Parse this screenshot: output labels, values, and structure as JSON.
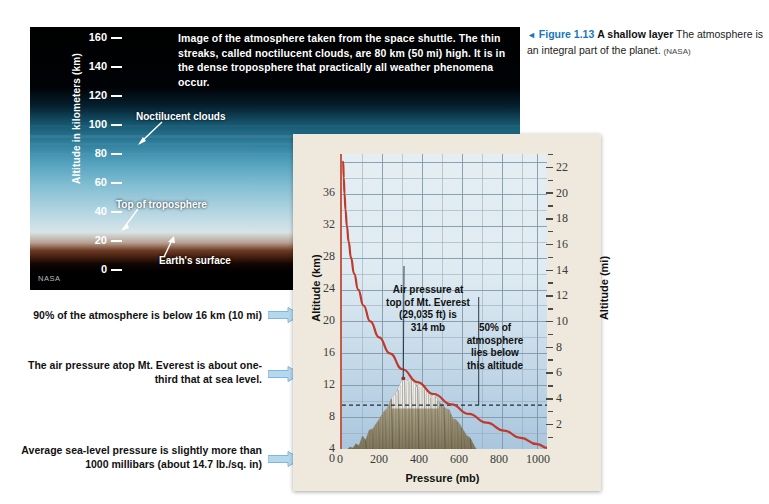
{
  "photo": {
    "description": "Image of the atmosphere taken from the space shuttle. The thin streaks, called noctilucent clouds, are 80 km (50 mi) high. It is in the dense troposphere that practically all weather phenomena occur.",
    "axis_title": "Altitude in kilometers (km)",
    "ticks": [
      "160",
      "140",
      "120",
      "100",
      "80",
      "60",
      "40",
      "20",
      "0"
    ],
    "labels": {
      "noctilucent": "Noctilucent clouds",
      "tropopause": "Top of troposphere",
      "surface": "Earth's surface"
    },
    "credit": "NASA"
  },
  "caption": {
    "triangle": "◄",
    "figure_number": "Figure 1.13",
    "figure_title": "A shallow layer",
    "text": " The atmosphere is an integral part of the planet. ",
    "source": "(NASA)"
  },
  "callouts": [
    {
      "text": "90% of the atmosphere is below 16 km (10 mi)"
    },
    {
      "text": "The air pressure atop Mt. Everest is about one-third that at sea level."
    },
    {
      "text": "Average sea-level pressure is slightly more than 1000 millibars (about 14.7 lb./sq. in)"
    }
  ],
  "chart_data": {
    "type": "line",
    "title": "",
    "xlabel": "Pressure (mb)",
    "ylabel": "Altitude (km)",
    "y2label": "Altitude (mi)",
    "xlim": [
      0,
      1050
    ],
    "ylim": [
      0,
      37
    ],
    "y2lim": [
      0,
      23
    ],
    "xticks": [
      "0",
      "200",
      "400",
      "600",
      "800",
      "1000"
    ],
    "xtick_values": [
      0,
      200,
      400,
      600,
      800,
      1000
    ],
    "yticks": [
      "4",
      "8",
      "12",
      "16",
      "20",
      "24",
      "28",
      "32",
      "36"
    ],
    "ytick_values": [
      4,
      8,
      12,
      16,
      20,
      24,
      28,
      32,
      36
    ],
    "y2ticks": [
      "2",
      "4",
      "6",
      "8",
      "10",
      "12",
      "14",
      "16",
      "18",
      "20",
      "22"
    ],
    "y2tick_values": [
      2,
      4,
      6,
      8,
      10,
      12,
      14,
      16,
      18,
      20,
      22
    ],
    "grid": true,
    "legend": "none",
    "series": [
      {
        "name": "Air pressure vs altitude",
        "color": "#c0392b",
        "x": [
          6,
          9,
          13,
          18,
          25,
          34,
          46,
          62,
          83,
          110,
          145,
          190,
          245,
          310,
          385,
          470,
          560,
          650,
          740,
          830,
          915,
          1000,
          1050
        ],
        "y": [
          36.0,
          34.0,
          32.0,
          30.0,
          28.0,
          26.0,
          24.0,
          22.0,
          20.0,
          18.0,
          16.0,
          14.0,
          12.0,
          10.0,
          8.4,
          6.9,
          5.6,
          4.4,
          3.3,
          2.3,
          1.4,
          0.6,
          0.15
        ]
      }
    ],
    "annotations": [
      {
        "name": "everest-annotation",
        "text": "Air pressure at top of Mt. Everest (29,035 ft) is 314 mb",
        "lines": [
          "Air pressure at",
          "top of Mt. Everest",
          "(29,035 ft) is",
          "314 mb"
        ],
        "point": {
          "x": 314,
          "y": 8.85
        }
      },
      {
        "name": "half-atmosphere-annotation",
        "text": "50% of atmosphere lies below this altitude",
        "lines": [
          "50% of",
          "atmosphere",
          "lies below",
          "this altitude"
        ],
        "point": {
          "x": 700,
          "y": 5.5
        }
      }
    ],
    "reference_line": {
      "name": "half-atmosphere-line",
      "y": 5.5,
      "style": "dashed"
    },
    "mountain": {
      "name": "mount-everest-silhouette",
      "peak": {
        "x": 314,
        "y": 8.85
      },
      "base_left": 30,
      "base_right": 690
    }
  },
  "colors": {
    "curve": "#c0392b",
    "panel_bg": "#eee9dc",
    "plot_bg": "#dfeaf2",
    "accent_blue": "#1577bd",
    "arrow_blue": "#9fcbe8"
  }
}
